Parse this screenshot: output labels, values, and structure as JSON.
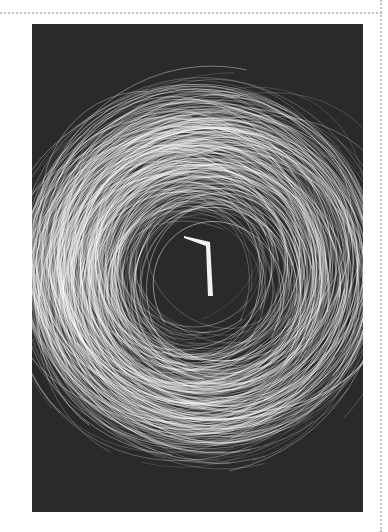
{
  "artwork": {
    "subject": "white-stroke-ring-on-dark-background",
    "background_color": "#2a2a2a",
    "stroke_color": "#ffffff",
    "center_glyph": "1"
  },
  "frame": {
    "style": "dotted",
    "color": "#c4c4c4"
  }
}
